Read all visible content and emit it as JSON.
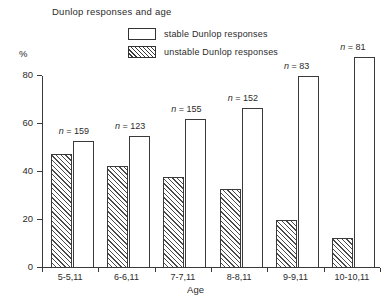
{
  "chart_data": {
    "type": "bar",
    "title": "Dunlop responses and age",
    "xlabel": "Age",
    "ylabel": "%",
    "ylim": [
      0,
      80
    ],
    "yticks": [
      0,
      20,
      40,
      60,
      80
    ],
    "ytick_labels": [
      "0",
      "20",
      "40",
      "60",
      "80"
    ],
    "grid": false,
    "legend_position": "top-center",
    "categories": [
      "5-5,11",
      "6-6,11",
      "7-7,11",
      "8-8,11",
      "9-9,11",
      "10-10,11"
    ],
    "series": [
      {
        "name": "unstable Dunlop responses",
        "fill": "hatched",
        "values": [
          47.5,
          42.5,
          38,
          33,
          20,
          12.5
        ]
      },
      {
        "name": "stable Dunlop responses",
        "fill": "white",
        "values": [
          53,
          55,
          62,
          66.5,
          80,
          88
        ]
      }
    ],
    "annotations": [
      {
        "category": "5-5,11",
        "text": "n = 159",
        "n": 159
      },
      {
        "category": "6-6,11",
        "text": "n = 123",
        "n": 123
      },
      {
        "category": "7-7,11",
        "text": "n = 155",
        "n": 155
      },
      {
        "category": "8-8,11",
        "text": "n = 152",
        "n": 152
      },
      {
        "category": "9-9,11",
        "text": "n = 83",
        "n": 83
      },
      {
        "category": "10-10,11",
        "text": "n = 81",
        "n": 81
      }
    ]
  },
  "legend": {
    "items": [
      {
        "label": "stable Dunlop responses",
        "swatch": "white-rectangle"
      },
      {
        "label": "unstable Dunlop responses",
        "swatch": "hatched-rectangle"
      }
    ]
  },
  "colors": {
    "line": "#3a3a3a",
    "text": "#2b2b2b",
    "background": "#ffffff",
    "hatch": "#4a4a4a"
  }
}
